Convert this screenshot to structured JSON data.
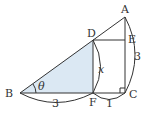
{
  "diagram": {
    "type": "geometry",
    "points": {
      "A": {
        "label": "A"
      },
      "B": {
        "label": "B"
      },
      "C": {
        "label": "C"
      },
      "D": {
        "label": "D"
      },
      "E": {
        "label": "E"
      },
      "F": {
        "label": "F"
      }
    },
    "measures": {
      "BF": "3",
      "FC": "1",
      "AC": "3",
      "DF": "x",
      "angle_B": "θ"
    },
    "shaded_region": "triangle DBF",
    "colors": {
      "shade": "#dbe8f3",
      "line": "#333333"
    }
  }
}
